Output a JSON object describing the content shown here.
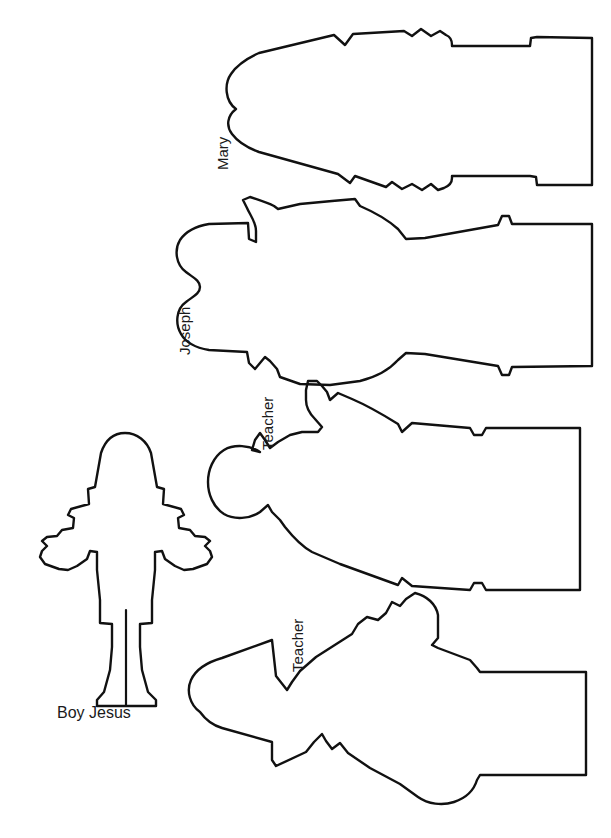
{
  "page": {
    "background_color": "#ffffff",
    "stroke_color": "#111111",
    "width": 611,
    "height": 838
  },
  "figures": [
    {
      "id": "mary",
      "label": "Mary",
      "orientation": "rotated-90-ccw",
      "label_rotation": "-90",
      "description": "robed standing figure outline lying on its side, head at left"
    },
    {
      "id": "joseph",
      "label": "Joseph",
      "orientation": "rotated-90-ccw",
      "label_rotation": "-90",
      "description": "robed standing figure outline with raised arm, lying on its side, head at left"
    },
    {
      "id": "teacher-1",
      "label": "Teacher",
      "orientation": "rotated-90-ccw",
      "label_rotation": "-90",
      "description": "robed standing figure outline with pointed hand gesture, lying on its side, head at left"
    },
    {
      "id": "teacher-2",
      "label": "Teacher",
      "orientation": "rotated-90-ccw",
      "label_rotation": "-90",
      "description": "robed standing figure outline with bearded profile, lying on its side, head at left"
    },
    {
      "id": "boy-jesus",
      "label": "Boy Jesus",
      "orientation": "upright",
      "label_rotation": "0",
      "description": "upright child figure outline with arms outstretched and tunic"
    }
  ]
}
